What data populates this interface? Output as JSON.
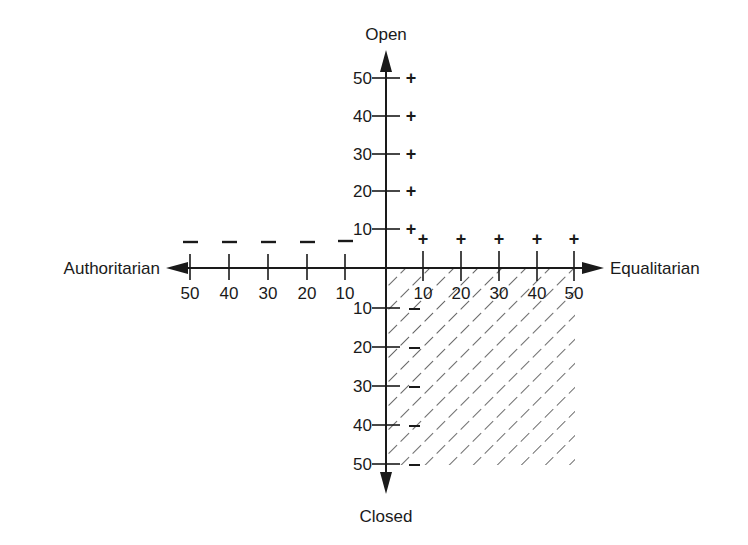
{
  "diagram": {
    "title": "",
    "axes": {
      "top_label": "Open",
      "bottom_label": "Closed",
      "left_label": "Authoritarian",
      "right_label": "Equalitarian"
    },
    "colors": {
      "ink": "#1a1a1a",
      "background": "#ffffff"
    },
    "ticks": {
      "up": [
        "50",
        "40",
        "30",
        "20",
        "10"
      ],
      "down": [
        "10",
        "20",
        "30",
        "40",
        "50"
      ],
      "left": [
        "50",
        "40",
        "30",
        "20",
        "10"
      ],
      "right": [
        "10",
        "20",
        "30",
        "40",
        "50"
      ]
    },
    "markers": {
      "up": [
        "+",
        "+",
        "+",
        "+",
        "+"
      ],
      "right": [
        "+",
        "+",
        "+",
        "+",
        "+"
      ],
      "left": [
        "–",
        "–",
        "–",
        "–",
        "–"
      ],
      "down": [
        "–",
        "–",
        "–",
        "–",
        "–"
      ]
    },
    "shaded_region": "Equalitarian-Closed quadrant (hatched)"
  }
}
